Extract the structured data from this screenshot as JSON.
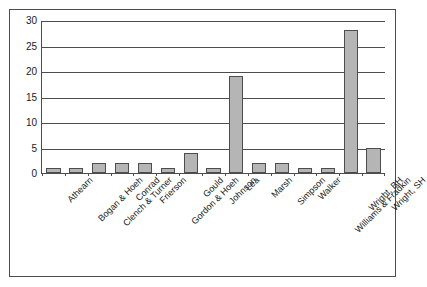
{
  "chart_data": {
    "type": "bar",
    "title": "",
    "subtitle": "",
    "xlabel": "",
    "ylabel": "",
    "ylim": [
      0,
      30
    ],
    "yticks": [
      0,
      5,
      10,
      15,
      20,
      25,
      30
    ],
    "grid": true,
    "legend": false,
    "legend_position": "none",
    "orientation": "vertical",
    "bar_fill_color": "#b5b5b5",
    "bar_edge_color": "#4d4d4d",
    "axis_color": "#4d4d4d",
    "background_color": "#ffffff",
    "categories": [
      "Athearn",
      "Bogan & Hoeh",
      "Clench & Turner",
      "Conrad",
      "Frierson",
      "Gordon & Hoeh",
      "Gould",
      "Johnson",
      "Lea",
      "Marsh",
      "Simpson",
      "Walker",
      "Williams & Fradkin",
      "Wright, BH",
      "Wright, SH"
    ],
    "values": [
      1,
      1,
      2,
      2,
      2,
      1,
      4,
      1,
      19,
      2,
      2,
      1,
      1,
      28,
      5
    ]
  }
}
